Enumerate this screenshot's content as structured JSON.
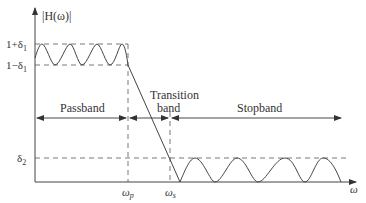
{
  "diagram": {
    "y_axis_label": "|H(ω)|",
    "x_axis_label": "ω",
    "levels": {
      "upper_pass": "1+δ",
      "upper_pass_sub": "1",
      "lower_pass": "1−δ",
      "lower_pass_sub": "1",
      "stop": "δ",
      "stop_sub": "2"
    },
    "frequencies": {
      "passband_edge": "ω",
      "passband_edge_sub": "p",
      "stopband_edge": "ω",
      "stopband_edge_sub": "s"
    },
    "bands": {
      "passband": "Passband",
      "transition_line1": "Transition",
      "transition_line2": "band",
      "stopband": "Stopband"
    },
    "colors": {
      "line": "#444444",
      "dash": "#555555",
      "text": "#333333"
    }
  }
}
